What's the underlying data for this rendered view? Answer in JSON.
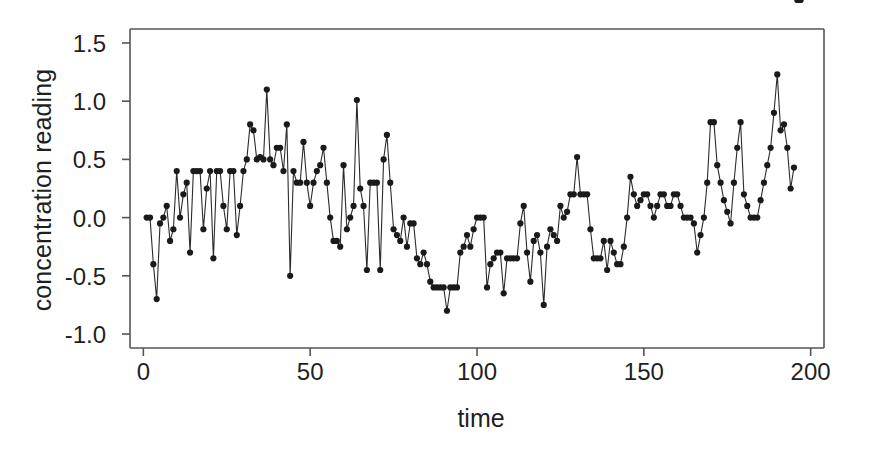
{
  "chart_data": {
    "type": "line",
    "title": "",
    "xlabel": "time",
    "ylabel": "concentration reading",
    "xlim": [
      -4,
      204
    ],
    "ylim": [
      -1.12,
      1.62
    ],
    "grid": false,
    "legend": null,
    "marker": "filled-circle",
    "line_color": "#2b2b2b",
    "marker_color": "#1a1a1a",
    "xticks": [
      0,
      50,
      100,
      150,
      200
    ],
    "xtick_labels": [
      "0",
      "50",
      "100",
      "150",
      "200"
    ],
    "yticks": [
      -1.0,
      -0.5,
      0.0,
      0.5,
      1.0,
      1.5
    ],
    "ytick_labels": [
      "-1.0",
      "-0.5",
      "0.0",
      "0.5",
      "1.0",
      "1.5"
    ],
    "x": [
      1,
      2,
      3,
      4,
      5,
      6,
      7,
      8,
      9,
      10,
      11,
      12,
      13,
      14,
      15,
      16,
      17,
      18,
      19,
      20,
      21,
      22,
      23,
      24,
      25,
      26,
      27,
      28,
      29,
      30,
      31,
      32,
      33,
      34,
      35,
      36,
      37,
      38,
      39,
      40,
      41,
      42,
      43,
      44,
      45,
      46,
      47,
      48,
      49,
      50,
      51,
      52,
      53,
      54,
      55,
      56,
      57,
      58,
      59,
      60,
      61,
      62,
      63,
      64,
      65,
      66,
      67,
      68,
      69,
      70,
      71,
      72,
      73,
      74,
      75,
      76,
      77,
      78,
      79,
      80,
      81,
      82,
      83,
      84,
      85,
      86,
      87,
      88,
      89,
      90,
      91,
      92,
      93,
      94,
      95,
      96,
      97,
      98,
      99,
      100,
      101,
      102,
      103,
      104,
      105,
      106,
      107,
      108,
      109,
      110,
      111,
      112,
      113,
      114,
      115,
      116,
      117,
      118,
      119,
      120,
      121,
      122,
      123,
      124,
      125,
      126,
      127,
      128,
      129,
      130,
      131,
      132,
      133,
      134,
      135,
      136,
      137,
      138,
      139,
      140,
      141,
      142,
      143,
      144,
      145,
      146,
      147,
      148,
      149,
      150,
      151,
      152,
      153,
      154,
      155,
      156,
      157,
      158,
      159,
      160,
      161,
      162,
      163,
      164,
      165,
      166,
      167,
      168,
      169,
      170,
      171,
      172,
      173,
      174,
      175,
      176,
      177,
      178,
      179,
      180,
      181,
      182,
      183,
      184,
      185,
      186,
      187,
      188,
      189,
      190,
      191,
      192,
      193,
      194,
      195,
      196,
      197
    ],
    "y": [
      0.0,
      0.0,
      -0.4,
      -0.7,
      -0.05,
      0.0,
      0.1,
      -0.2,
      -0.1,
      0.4,
      0.0,
      0.2,
      0.3,
      -0.3,
      0.4,
      0.4,
      0.4,
      -0.1,
      0.25,
      0.4,
      -0.35,
      0.4,
      0.4,
      0.1,
      -0.1,
      0.4,
      0.4,
      -0.15,
      0.1,
      0.4,
      0.5,
      0.8,
      0.75,
      0.5,
      0.52,
      0.5,
      1.1,
      0.5,
      0.45,
      0.6,
      0.6,
      0.4,
      0.8,
      -0.5,
      0.4,
      0.3,
      0.3,
      0.65,
      0.3,
      0.1,
      0.3,
      0.4,
      0.45,
      0.6,
      0.3,
      0.0,
      -0.2,
      -0.2,
      -0.25,
      0.45,
      -0.1,
      0.0,
      0.1,
      1.01,
      0.25,
      0.1,
      -0.45,
      0.3,
      0.3,
      0.3,
      -0.45,
      0.5,
      0.71,
      0.3,
      -0.1,
      -0.15,
      -0.2,
      0.0,
      -0.25,
      -0.05,
      -0.05,
      -0.35,
      -0.4,
      -0.3,
      -0.4,
      -0.55,
      -0.6,
      -0.6,
      -0.6,
      -0.6,
      -0.8,
      -0.6,
      -0.6,
      -0.6,
      -0.3,
      -0.25,
      -0.15,
      -0.25,
      -0.1,
      0.0,
      0.0,
      0.0,
      -0.6,
      -0.4,
      -0.35,
      -0.3,
      -0.3,
      -0.65,
      -0.35,
      -0.35,
      -0.35,
      -0.35,
      -0.05,
      0.1,
      -0.3,
      -0.55,
      -0.2,
      -0.15,
      -0.3,
      -0.75,
      -0.25,
      -0.1,
      -0.15,
      -0.2,
      0.1,
      0.0,
      0.05,
      0.2,
      0.2,
      0.52,
      0.2,
      0.2,
      0.2,
      -0.1,
      -0.35,
      -0.35,
      -0.35,
      -0.2,
      -0.45,
      -0.2,
      -0.3,
      -0.4,
      -0.4,
      -0.25,
      0.0,
      0.35,
      0.2,
      0.1,
      0.15,
      0.2,
      0.2,
      0.1,
      0.0,
      0.1,
      0.2,
      0.2,
      0.1,
      0.1,
      0.2,
      0.2,
      0.1,
      0.0,
      0.0,
      0.0,
      -0.05,
      -0.3,
      -0.15,
      0.0,
      0.3,
      0.82,
      0.82,
      0.45,
      0.3,
      0.15,
      0.05,
      -0.05,
      0.3,
      0.6,
      0.82,
      0.2,
      0.1,
      0.0,
      0.0,
      0.0,
      0.15,
      0.3,
      0.45,
      0.6,
      0.9,
      1.23,
      0.75,
      0.8,
      0.6,
      0.25,
      0.43
    ]
  },
  "axes": {
    "frame_color": "#555555"
  }
}
